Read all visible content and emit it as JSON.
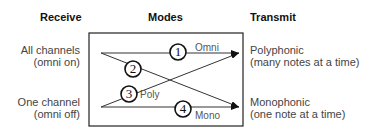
{
  "headers": {
    "receive": "Receive",
    "modes": "Modes",
    "transmit": "Transmit"
  },
  "receive": [
    {
      "line1": "All channels",
      "line2": "(omni on)"
    },
    {
      "line1": "One channel",
      "line2": "(omni off)"
    }
  ],
  "transmit": [
    {
      "line1": "Polyphonic",
      "line2": "(many notes at a time)"
    },
    {
      "line1": "Monophonic",
      "line2": "(one note at a time)"
    }
  ],
  "modes": [
    {
      "number": "1"
    },
    {
      "number": "2"
    },
    {
      "number": "3"
    },
    {
      "number": "4"
    }
  ],
  "line_labels": {
    "omni": "Omni",
    "poly": "Poly",
    "mono": "Mono"
  }
}
